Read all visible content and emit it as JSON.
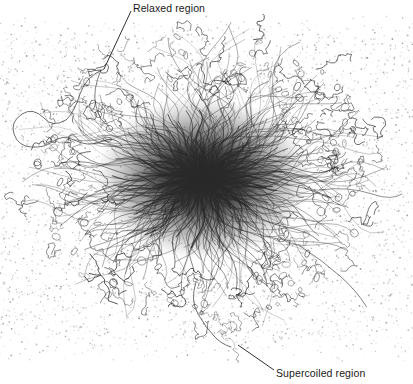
{
  "figure": {
    "type": "electron-micrograph",
    "width": 413,
    "height": 384,
    "background_color": "#ffffff",
    "ink_color": "#1a1a1a"
  },
  "annotations": {
    "relaxed": {
      "label": "Relaxed region",
      "text_x": 133,
      "text_y": 2,
      "leader_from_x": 131,
      "leader_from_y": 11,
      "leader_to_x": 104,
      "leader_to_y": 69
    },
    "supercoiled": {
      "label": "Supercoiled region",
      "text_x": 276,
      "text_y": 367,
      "leader_from_x": 274,
      "leader_from_y": 370,
      "leader_to_x": 238,
      "leader_to_y": 345
    }
  },
  "plate": {
    "left": 0,
    "top": 14,
    "width": 413,
    "height": 349,
    "grain_color": "#8d8d8d",
    "grain_density": "fine-scattered"
  },
  "nucleoid": {
    "core_center_x": 203,
    "core_center_y": 178,
    "core_radius_x": 72,
    "core_radius_y": 56,
    "core_color": "#141414",
    "fiber_color": "#2a2a2a",
    "halo_radius_x": 175,
    "halo_radius_y": 145,
    "fiber_count": 260,
    "loop_count": 150
  }
}
